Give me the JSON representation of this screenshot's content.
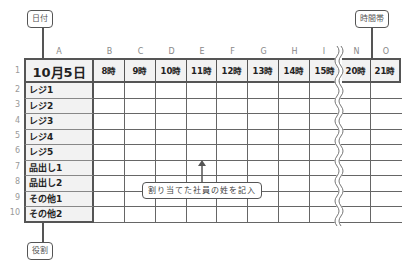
{
  "callouts": {
    "date": "日付",
    "timeslot": "時間帯",
    "role": "役割",
    "instruction": "割り当てた社員の姓を記入"
  },
  "columns": [
    "A",
    "B",
    "C",
    "D",
    "E",
    "F",
    "G",
    "H",
    "I",
    "N",
    "O"
  ],
  "header": {
    "date": "10月5日",
    "hours": [
      "8時",
      "9時",
      "10時",
      "11時",
      "12時",
      "13時",
      "14時",
      "15時",
      "20時",
      "21時"
    ]
  },
  "row_numbers": [
    "1",
    "2",
    "3",
    "4",
    "5",
    "6",
    "7",
    "8",
    "9",
    "10"
  ],
  "roles": [
    "レジ1",
    "レジ2",
    "レジ3",
    "レジ4",
    "レジ5",
    "品出し1",
    "品出し2",
    "その他1",
    "その他2"
  ]
}
